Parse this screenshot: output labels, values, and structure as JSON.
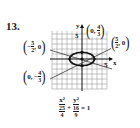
{
  "problem_number": "13.",
  "graph": {
    "axis_labels": {
      "x": "x",
      "y": "y"
    },
    "tick_labels": {
      "x_5": "5",
      "y_5": "5"
    },
    "points": [
      {
        "id": "left-vertex",
        "x_num": "5",
        "x_den": "2",
        "x_sign": "−",
        "y": "0"
      },
      {
        "id": "right-vertex",
        "x_num": "5",
        "x_den": "2",
        "y": "0"
      },
      {
        "id": "top-vertex",
        "x": "0",
        "y_num": "4",
        "y_den": "3"
      },
      {
        "id": "bottom-vertex",
        "x": "0",
        "y_num": "4",
        "y_den": "3",
        "y_sign": "−"
      }
    ],
    "colors": {
      "grid": "#9a9a9a",
      "curve": "#111111",
      "axis": "#111111"
    }
  },
  "equation": {
    "term1_num": "x²",
    "term1_den_num": "25",
    "term1_den_den": "4",
    "plus": "+",
    "term2_num": "y²",
    "term2_den_num": "16",
    "term2_den_den": "9",
    "equals": "= 1"
  }
}
